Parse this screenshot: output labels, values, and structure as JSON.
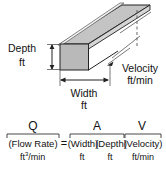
{
  "figure": {
    "colors": {
      "face_fill": "#b9b9b9",
      "top_fill": "#c9c9c9",
      "outline": "#222222",
      "text": "#111111",
      "background": "#ffffff"
    }
  },
  "diagram": {
    "depth_label": "Depth",
    "depth_unit": "ft",
    "width_label": "Width",
    "width_unit": "ft",
    "velocity_label": "Velocity",
    "velocity_unit": "ft/min"
  },
  "equation": {
    "equals_sign": "=",
    "terms": [
      {
        "symbol": "Q",
        "name": "(Flow Rate)",
        "unit": "ft",
        "unit_superscript": "3",
        "unit_suffix": "/min"
      },
      {
        "symbol": "A",
        "name": "(Width)(Depth)",
        "name_parts": [
          "(Width)",
          "(Depth)"
        ],
        "unit_parts": [
          "ft",
          "ft"
        ]
      },
      {
        "symbol": "V",
        "name": "(Velocity)",
        "unit": "ft/min"
      }
    ]
  }
}
